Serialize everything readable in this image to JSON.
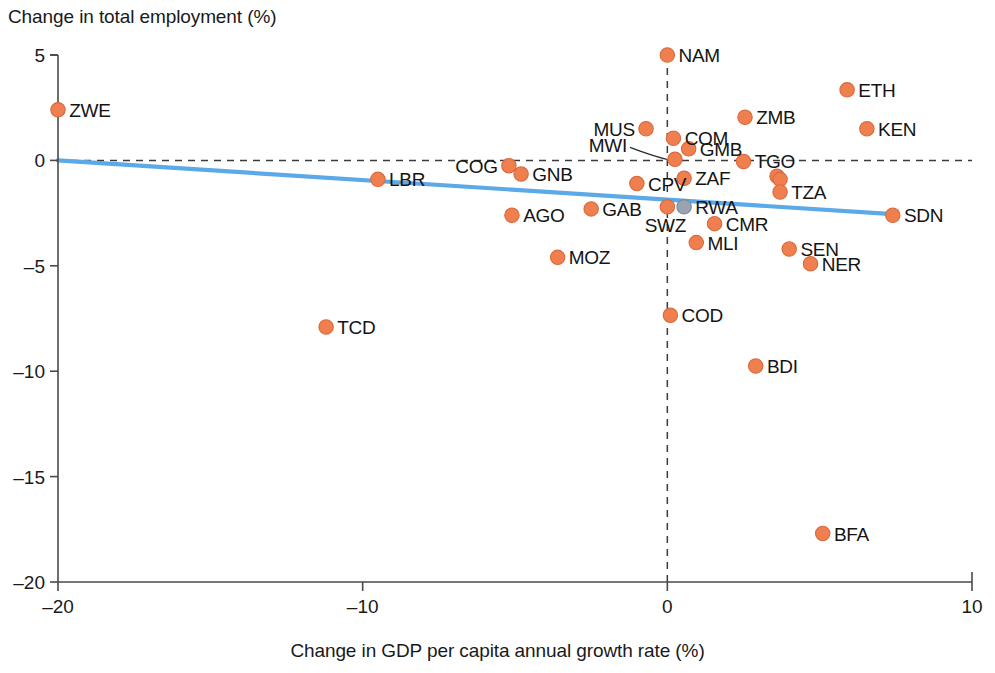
{
  "chart_data": {
    "type": "scatter",
    "title": "",
    "xlabel": "Change in GDP per capita annual growth rate (%)",
    "ylabel": "Change in total employment (%)",
    "xlim": [
      -20,
      10
    ],
    "ylim": [
      -20,
      5
    ],
    "xticks": [
      -20,
      -10,
      0,
      10
    ],
    "xtick_labels": [
      "–20",
      "–10",
      "0",
      "10"
    ],
    "yticks": [
      5,
      0,
      -5,
      -10,
      -15,
      -20
    ],
    "ytick_labels": [
      "5",
      "0",
      "–5",
      "–10",
      "–15",
      "–20"
    ],
    "grid": false,
    "legend": null,
    "reference_lines": [
      {
        "name": "zero-horizontal",
        "orientation": "horizontal",
        "value": 0,
        "style": "dashed"
      },
      {
        "name": "zero-vertical",
        "orientation": "vertical",
        "value": 0,
        "style": "dashed"
      }
    ],
    "trendline": {
      "name": "linear-fit",
      "color": "#5ca9e8",
      "x_start": -20,
      "y_start": 0.0,
      "x_end": 7.4,
      "y_end": -2.55
    },
    "marker_color": "#f07f50",
    "points": [
      {
        "label": "ZWE",
        "x": -20.0,
        "y": 2.4,
        "label_pos": "right"
      },
      {
        "label": "TCD",
        "x": -11.2,
        "y": -7.9,
        "label_pos": "right"
      },
      {
        "label": "LBR",
        "x": -9.5,
        "y": -0.9,
        "label_pos": "right"
      },
      {
        "label": "COG",
        "x": -5.2,
        "y": -0.25,
        "label_pos": "left"
      },
      {
        "label": "GNB",
        "x": -4.8,
        "y": -0.65,
        "label_pos": "right"
      },
      {
        "label": "AGO",
        "x": -5.1,
        "y": -2.6,
        "label_pos": "right"
      },
      {
        "label": "MOZ",
        "x": -3.6,
        "y": -4.6,
        "label_pos": "right"
      },
      {
        "label": "GAB",
        "x": -2.5,
        "y": -2.3,
        "label_pos": "right"
      },
      {
        "label": "CPV",
        "x": -1.0,
        "y": -1.1,
        "label_pos": "right"
      },
      {
        "label": "MUS",
        "x": -0.7,
        "y": 1.5,
        "label_pos": "left"
      },
      {
        "label": "COM",
        "x": 0.2,
        "y": 1.05,
        "label_pos": "right"
      },
      {
        "label": "NAM",
        "x": 0.0,
        "y": 5.0,
        "label_pos": "right"
      },
      {
        "label": "MWI",
        "x": 0.25,
        "y": 0.05,
        "label_pos": "leader-left"
      },
      {
        "label": "GMB",
        "x": 0.7,
        "y": 0.55,
        "label_pos": "right"
      },
      {
        "label": "ZAF",
        "x": 0.55,
        "y": -0.85,
        "label_pos": "right"
      },
      {
        "label": "SWZ",
        "x": 0.0,
        "y": -2.2,
        "label_pos": "below"
      },
      {
        "label": "RWA",
        "x": 0.55,
        "y": -2.2,
        "label_pos": "right"
      },
      {
        "label": "MLI",
        "x": 0.95,
        "y": -3.9,
        "label_pos": "right"
      },
      {
        "label": "CMR",
        "x": 1.55,
        "y": -3.0,
        "label_pos": "right"
      },
      {
        "label": "ZMB",
        "x": 2.55,
        "y": 2.05,
        "label_pos": "right"
      },
      {
        "label": "TGO",
        "x": 2.5,
        "y": -0.05,
        "label_pos": "right"
      },
      {
        "label": "",
        "x": 3.6,
        "y": -0.75,
        "label_pos": "none"
      },
      {
        "label": "",
        "x": 3.7,
        "y": -0.9,
        "label_pos": "none"
      },
      {
        "label": "TZA",
        "x": 3.7,
        "y": -1.5,
        "label_pos": "right"
      },
      {
        "label": "ETH",
        "x": 5.9,
        "y": 3.35,
        "label_pos": "right"
      },
      {
        "label": "KEN",
        "x": 6.55,
        "y": 1.5,
        "label_pos": "right"
      },
      {
        "label": "SDN",
        "x": 7.4,
        "y": -2.6,
        "label_pos": "right"
      },
      {
        "label": "SEN",
        "x": 4.0,
        "y": -4.2,
        "label_pos": "right"
      },
      {
        "label": "NER",
        "x": 4.7,
        "y": -4.9,
        "label_pos": "right"
      },
      {
        "label": "COD",
        "x": 0.1,
        "y": -7.35,
        "label_pos": "right"
      },
      {
        "label": "BDI",
        "x": 2.9,
        "y": -9.75,
        "label_pos": "right"
      },
      {
        "label": "BFA",
        "x": 5.1,
        "y": -17.7,
        "label_pos": "right"
      }
    ]
  }
}
